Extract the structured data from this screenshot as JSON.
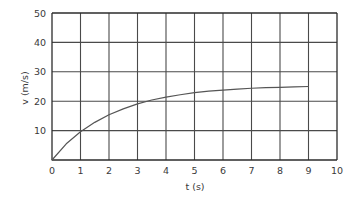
{
  "chart_data": {
    "type": "line",
    "title": "",
    "xlabel": "t (s)",
    "ylabel": "v (m/s)",
    "xlim": [
      0,
      10
    ],
    "ylim": [
      0,
      50
    ],
    "grid": true,
    "legend": "none",
    "x_ticks": [
      "0",
      "1",
      "2",
      "3",
      "4",
      "5",
      "6",
      "7",
      "8",
      "9",
      "10"
    ],
    "x_tick_values": [
      0,
      1,
      2,
      3,
      4,
      5,
      6,
      7,
      8,
      9,
      10
    ],
    "y_ticks": [
      "10",
      "20",
      "30",
      "40",
      "50"
    ],
    "y_tick_values": [
      10,
      20,
      30,
      40,
      50
    ],
    "x_gridline_step": 1,
    "y_gridline_step": 10,
    "series": [
      {
        "name": "velocity",
        "color": "#555555",
        "x": [
          0,
          0.5,
          1,
          1.5,
          2,
          2.5,
          3,
          3.5,
          4,
          4.5,
          5,
          5.5,
          6,
          6.5,
          7,
          7.5,
          8,
          8.5,
          9
        ],
        "values": [
          0,
          5.5,
          9.6,
          12.8,
          15.4,
          17.4,
          19.1,
          20.4,
          21.4,
          22.2,
          22.9,
          23.4,
          23.8,
          24.1,
          24.4,
          24.6,
          24.7,
          24.9,
          25.0
        ],
        "x_end": 9,
        "y_asymptote": 25
      }
    ]
  },
  "axes": {
    "x_title": "t (s)",
    "y_title": "v (m/s)"
  },
  "style": {
    "background": "#ffffff",
    "grid_color": "#4a4a4a",
    "axis_color": "#2b2b2b",
    "curve_color": "#555555",
    "text_color": "#3a3a3a"
  }
}
